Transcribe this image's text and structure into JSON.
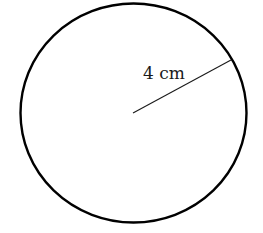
{
  "diagram": {
    "type": "circle-with-radius",
    "radius_label": "4 cm",
    "radius_value": 4,
    "radius_unit": "cm",
    "colors": {
      "stroke": "#000000",
      "radius_line": "#1a1a1a",
      "background": "#ffffff"
    }
  }
}
